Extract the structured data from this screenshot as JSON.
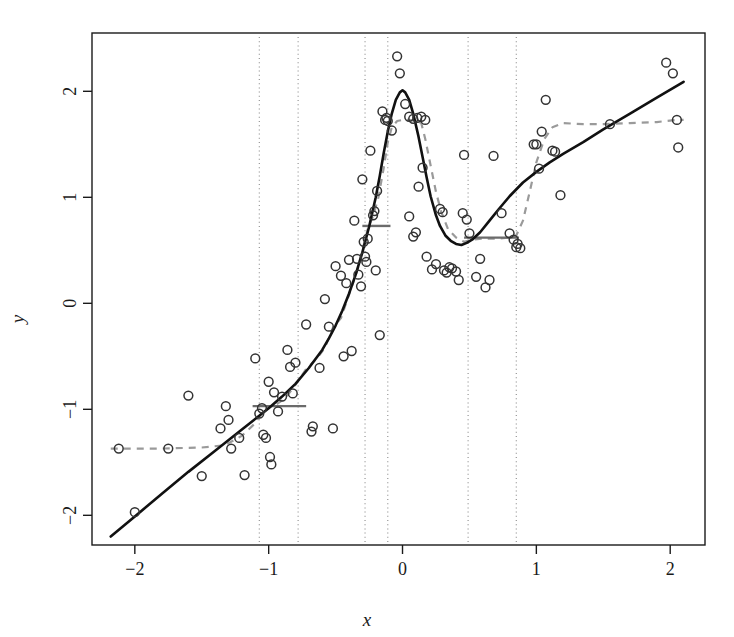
{
  "chart_data": {
    "type": "scatter",
    "title": "",
    "subtitle": "",
    "xlabel": "x",
    "ylabel": "y",
    "xlim": [
      -2.32,
      2.26
    ],
    "ylim": [
      -2.28,
      2.55
    ],
    "xticks": [
      -2,
      -1,
      0,
      1,
      2
    ],
    "xtick_labels": [
      "−2",
      "−1",
      "0",
      "1",
      "2"
    ],
    "yticks": [
      -2,
      -1,
      0,
      1,
      2
    ],
    "ytick_labels": [
      "−2",
      "−1",
      "0",
      "1",
      "2"
    ],
    "grid": false,
    "frame": true,
    "legend": null,
    "colors": {
      "points": "#333333",
      "true_curve": "#111111",
      "fitted_dashed": "#9a9a9a",
      "segments": "#6b6b6b",
      "knot_lines": "#8a8a8a",
      "axis": "#1a1a1a",
      "background": "#ffffff"
    },
    "annotations": {
      "knot_lines_style": "dotted vertical",
      "true_curve_style": "solid black",
      "fitted_style": "dashed gray",
      "segment_style": "solid gray horizontal"
    },
    "knots": [
      -1.07,
      -0.78,
      -0.28,
      -0.11,
      0.49,
      0.85
    ],
    "series": [
      {
        "name": "observations",
        "type": "scatter",
        "marker": "open-circle",
        "points": [
          [
            -2.0,
            -1.97
          ],
          [
            -2.12,
            -1.37
          ],
          [
            -1.75,
            -1.37
          ],
          [
            -1.6,
            -0.87
          ],
          [
            -1.5,
            -1.63
          ],
          [
            -1.36,
            -1.18
          ],
          [
            -1.32,
            -0.97
          ],
          [
            -1.3,
            -1.1
          ],
          [
            -1.28,
            -1.37
          ],
          [
            -1.22,
            -1.27
          ],
          [
            -1.18,
            -1.62
          ],
          [
            -1.1,
            -0.52
          ],
          [
            -1.07,
            -1.04
          ],
          [
            -1.05,
            -0.99
          ],
          [
            -1.04,
            -1.24
          ],
          [
            -1.02,
            -1.27
          ],
          [
            -1.0,
            -0.74
          ],
          [
            -0.99,
            -1.45
          ],
          [
            -0.98,
            -1.52
          ],
          [
            -0.96,
            -0.84
          ],
          [
            -0.93,
            -1.02
          ],
          [
            -0.9,
            -0.88
          ],
          [
            -0.86,
            -0.44
          ],
          [
            -0.84,
            -0.6
          ],
          [
            -0.82,
            -0.85
          ],
          [
            -0.8,
            -0.56
          ],
          [
            -0.72,
            -0.2
          ],
          [
            -0.68,
            -1.21
          ],
          [
            -0.67,
            -1.16
          ],
          [
            -0.62,
            -0.61
          ],
          [
            -0.58,
            0.04
          ],
          [
            -0.55,
            -0.22
          ],
          [
            -0.52,
            -1.18
          ],
          [
            -0.5,
            0.35
          ],
          [
            -0.46,
            0.26
          ],
          [
            -0.44,
            -0.5
          ],
          [
            -0.42,
            0.19
          ],
          [
            -0.4,
            0.41
          ],
          [
            -0.38,
            -0.45
          ],
          [
            -0.36,
            0.78
          ],
          [
            -0.34,
            0.42
          ],
          [
            -0.33,
            0.27
          ],
          [
            -0.31,
            0.16
          ],
          [
            -0.3,
            1.17
          ],
          [
            -0.29,
            0.58
          ],
          [
            -0.28,
            0.44
          ],
          [
            -0.27,
            0.39
          ],
          [
            -0.26,
            0.61
          ],
          [
            -0.24,
            1.44
          ],
          [
            -0.22,
            0.83
          ],
          [
            -0.21,
            0.87
          ],
          [
            -0.2,
            0.31
          ],
          [
            -0.19,
            1.06
          ],
          [
            -0.17,
            -0.3
          ],
          [
            -0.15,
            1.81
          ],
          [
            -0.13,
            1.73
          ],
          [
            -0.12,
            1.75
          ],
          [
            -0.11,
            1.72
          ],
          [
            -0.08,
            1.63
          ],
          [
            -0.04,
            2.33
          ],
          [
            -0.02,
            2.17
          ],
          [
            0.02,
            1.88
          ],
          [
            0.05,
            1.76
          ],
          [
            0.08,
            1.74
          ],
          [
            0.11,
            1.75
          ],
          [
            0.14,
            1.76
          ],
          [
            0.17,
            1.73
          ],
          [
            0.05,
            0.82
          ],
          [
            0.08,
            0.63
          ],
          [
            0.1,
            0.67
          ],
          [
            0.12,
            1.1
          ],
          [
            0.15,
            1.28
          ],
          [
            0.18,
            0.44
          ],
          [
            0.22,
            0.32
          ],
          [
            0.25,
            0.37
          ],
          [
            0.28,
            0.89
          ],
          [
            0.3,
            0.86
          ],
          [
            0.31,
            0.31
          ],
          [
            0.33,
            0.29
          ],
          [
            0.35,
            0.34
          ],
          [
            0.37,
            0.33
          ],
          [
            0.4,
            0.3
          ],
          [
            0.42,
            0.22
          ],
          [
            0.45,
            0.85
          ],
          [
            0.46,
            1.4
          ],
          [
            0.48,
            0.79
          ],
          [
            0.5,
            0.66
          ],
          [
            0.55,
            0.25
          ],
          [
            0.58,
            0.42
          ],
          [
            0.62,
            0.15
          ],
          [
            0.65,
            0.22
          ],
          [
            0.68,
            1.39
          ],
          [
            0.74,
            0.85
          ],
          [
            0.8,
            0.66
          ],
          [
            0.83,
            0.6
          ],
          [
            0.85,
            0.53
          ],
          [
            0.86,
            0.56
          ],
          [
            0.88,
            0.52
          ],
          [
            0.98,
            1.5
          ],
          [
            1.0,
            1.5
          ],
          [
            1.02,
            1.27
          ],
          [
            1.04,
            1.62
          ],
          [
            1.07,
            1.92
          ],
          [
            1.12,
            1.44
          ],
          [
            1.14,
            1.43
          ],
          [
            1.18,
            1.02
          ],
          [
            1.55,
            1.69
          ],
          [
            1.97,
            2.27
          ],
          [
            2.02,
            2.17
          ],
          [
            2.05,
            1.73
          ],
          [
            2.06,
            1.47
          ]
        ]
      },
      {
        "name": "true-function",
        "type": "line",
        "style": "solid",
        "color": "#111111",
        "points": [
          [
            -2.18,
            -2.2
          ],
          [
            -2.0,
            -2.01
          ],
          [
            -1.8,
            -1.8
          ],
          [
            -1.6,
            -1.59
          ],
          [
            -1.4,
            -1.39
          ],
          [
            -1.2,
            -1.19
          ],
          [
            -1.0,
            -0.99
          ],
          [
            -0.9,
            -0.88
          ],
          [
            -0.8,
            -0.76
          ],
          [
            -0.7,
            -0.61
          ],
          [
            -0.6,
            -0.44
          ],
          [
            -0.55,
            -0.33
          ],
          [
            -0.5,
            -0.21
          ],
          [
            -0.45,
            -0.07
          ],
          [
            -0.4,
            0.09
          ],
          [
            -0.35,
            0.27
          ],
          [
            -0.3,
            0.48
          ],
          [
            -0.25,
            0.72
          ],
          [
            -0.2,
            1.0
          ],
          [
            -0.17,
            1.2
          ],
          [
            -0.14,
            1.42
          ],
          [
            -0.11,
            1.62
          ],
          [
            -0.08,
            1.79
          ],
          [
            -0.05,
            1.92
          ],
          [
            -0.02,
            1.99
          ],
          [
            0.0,
            2.01
          ],
          [
            0.02,
            1.99
          ],
          [
            0.05,
            1.92
          ],
          [
            0.08,
            1.79
          ],
          [
            0.12,
            1.57
          ],
          [
            0.15,
            1.38
          ],
          [
            0.18,
            1.19
          ],
          [
            0.21,
            1.01
          ],
          [
            0.25,
            0.83
          ],
          [
            0.28,
            0.73
          ],
          [
            0.32,
            0.64
          ],
          [
            0.36,
            0.59
          ],
          [
            0.4,
            0.56
          ],
          [
            0.44,
            0.55
          ],
          [
            0.48,
            0.57
          ],
          [
            0.52,
            0.6
          ],
          [
            0.58,
            0.67
          ],
          [
            0.65,
            0.78
          ],
          [
            0.72,
            0.89
          ],
          [
            0.8,
            1.01
          ],
          [
            0.9,
            1.14
          ],
          [
            1.0,
            1.24
          ],
          [
            1.1,
            1.33
          ],
          [
            1.2,
            1.41
          ],
          [
            1.35,
            1.52
          ],
          [
            1.5,
            1.64
          ],
          [
            1.7,
            1.79
          ],
          [
            1.9,
            1.94
          ],
          [
            2.1,
            2.09
          ]
        ]
      },
      {
        "name": "fitted-estimate",
        "type": "line",
        "style": "dashed",
        "color": "#9a9a9a",
        "points": [
          [
            -2.18,
            -1.37
          ],
          [
            -1.8,
            -1.37
          ],
          [
            -1.5,
            -1.36
          ],
          [
            -1.33,
            -1.34
          ],
          [
            -1.2,
            -1.25
          ],
          [
            -1.1,
            -1.13
          ],
          [
            -1.05,
            -1.03
          ],
          [
            -1.0,
            -0.98
          ],
          [
            -0.95,
            -0.96
          ],
          [
            -0.88,
            -0.9
          ],
          [
            -0.8,
            -0.77
          ],
          [
            -0.72,
            -0.62
          ],
          [
            -0.64,
            -0.52
          ],
          [
            -0.58,
            -0.42
          ],
          [
            -0.52,
            -0.23
          ],
          [
            -0.46,
            -0.14
          ],
          [
            -0.4,
            0.08
          ],
          [
            -0.34,
            0.3
          ],
          [
            -0.3,
            0.5
          ],
          [
            -0.26,
            0.7
          ],
          [
            -0.22,
            0.82
          ],
          [
            -0.18,
            1.0
          ],
          [
            -0.14,
            1.28
          ],
          [
            -0.11,
            1.52
          ],
          [
            -0.08,
            1.66
          ],
          [
            -0.04,
            1.72
          ],
          [
            0.0,
            1.73
          ],
          [
            0.05,
            1.73
          ],
          [
            0.1,
            1.72
          ],
          [
            0.14,
            1.7
          ],
          [
            0.17,
            1.55
          ],
          [
            0.21,
            1.3
          ],
          [
            0.25,
            1.05
          ],
          [
            0.29,
            0.86
          ],
          [
            0.34,
            0.7
          ],
          [
            0.4,
            0.62
          ],
          [
            0.46,
            0.58
          ],
          [
            0.52,
            0.6
          ],
          [
            0.6,
            0.61
          ],
          [
            0.7,
            0.61
          ],
          [
            0.8,
            0.62
          ],
          [
            0.85,
            0.64
          ],
          [
            0.9,
            0.78
          ],
          [
            0.95,
            1.05
          ],
          [
            1.0,
            1.33
          ],
          [
            1.06,
            1.55
          ],
          [
            1.12,
            1.66
          ],
          [
            1.2,
            1.7
          ],
          [
            1.35,
            1.69
          ],
          [
            1.5,
            1.69
          ],
          [
            1.7,
            1.7
          ],
          [
            1.9,
            1.71
          ],
          [
            2.05,
            1.73
          ],
          [
            2.1,
            1.73
          ]
        ]
      },
      {
        "name": "local-level-segments",
        "type": "hsegments",
        "color": "#6b6b6b",
        "segments": [
          {
            "x0": -1.12,
            "x1": -0.72,
            "y": -0.97
          },
          {
            "x0": -0.3,
            "x1": -0.09,
            "y": 0.73
          },
          {
            "x0": 0.46,
            "x1": 0.87,
            "y": 0.62
          }
        ]
      }
    ]
  },
  "axes": {
    "x_title": "x",
    "y_title": "y"
  }
}
